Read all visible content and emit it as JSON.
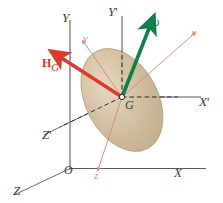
{
  "figure": {
    "kind": "physics-vector-diagram"
  },
  "colors": {
    "fixed_axis": "#555555",
    "translating_axis": "#555555",
    "body_axis": "#d08a72",
    "omega_vector": "#0e8049",
    "hg_vector": "#dc3b2c",
    "body_fill": "#cbb392",
    "body_edge": "#b59a78",
    "dashed_line": "#3a3a3a",
    "background": "#ffffff"
  },
  "labels": {
    "fixed_Y": "Y",
    "fixed_X": "X",
    "fixed_Z": "Z",
    "origin_O": "O",
    "translating_Y": "Y",
    "translating_Y_prime": "'",
    "translating_X": "X",
    "translating_X_prime": "'",
    "translating_Z": "Z",
    "translating_Z_prime": "'",
    "body_x": "x",
    "body_y": "y",
    "body_z": "z",
    "center_G": "G",
    "omega": "ω",
    "hg_main": "H",
    "hg_sub": "G"
  },
  "vectors": [
    {
      "name": "omega",
      "label": "ω",
      "color": "#0e8049",
      "from": [
        122,
        97
      ],
      "to": [
        152,
        22
      ],
      "description": "angular velocity vector, green, points up and to the right from G"
    },
    {
      "name": "H_G",
      "label": "H_G",
      "color": "#dc3b2c",
      "from": [
        122,
        97
      ],
      "to": [
        56,
        54
      ],
      "description": "angular momentum vector about G, red, points up and to the left from G"
    }
  ],
  "axes": [
    {
      "name": "fixed-Y",
      "label": "Y",
      "from": [
        70,
        168
      ],
      "to": [
        70,
        22
      ],
      "color": "#555555"
    },
    {
      "name": "fixed-X",
      "label": "X",
      "from": [
        70,
        168
      ],
      "to": [
        205,
        168
      ],
      "color": "#555555"
    },
    {
      "name": "fixed-Z",
      "label": "Z",
      "from": [
        70,
        168
      ],
      "to": [
        12,
        196
      ],
      "color": "#555555"
    },
    {
      "name": "translating-Y-prime",
      "label": "Y'",
      "from": [
        122,
        97
      ],
      "to": [
        122,
        14
      ],
      "color": "#555555"
    },
    {
      "name": "translating-X-prime",
      "label": "X'",
      "from": [
        122,
        97
      ],
      "to": [
        200,
        97
      ],
      "color": "#555555"
    },
    {
      "name": "translating-Z-prime",
      "label": "Z'",
      "from": [
        122,
        97
      ],
      "to": [
        55,
        130
      ],
      "color": "#555555"
    },
    {
      "name": "body-x",
      "label": "x",
      "from": [
        122,
        97
      ],
      "to": [
        196,
        32
      ],
      "color": "#d08a72"
    },
    {
      "name": "body-y",
      "label": "y",
      "from": [
        122,
        97
      ],
      "to": [
        82,
        40
      ],
      "color": "#d08a72"
    },
    {
      "name": "body-z",
      "label": "z",
      "from": [
        122,
        97
      ],
      "to": [
        98,
        172
      ],
      "color": "#d08a72"
    }
  ],
  "body": {
    "name": "rigid-body-ellipsoid",
    "center": [
      122,
      100
    ],
    "rx": 36,
    "ry": 55,
    "rotation_deg": -28,
    "fill": "#cbb392"
  }
}
